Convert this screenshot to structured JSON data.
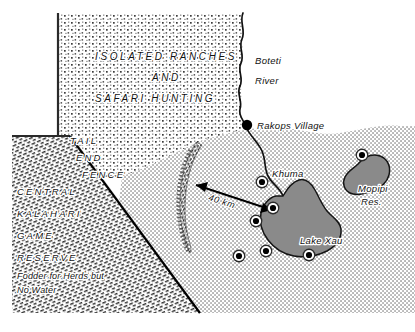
{
  "map": {
    "title": "Kalahari cattle-post map",
    "width": 415,
    "height": 332,
    "colors": {
      "paper": "#ffffff",
      "ink": "#111111",
      "water": "#8a8a8a",
      "water_outline": "#1a1a1a",
      "stipple_coarse": "#3a3a3a",
      "stipple_fine": "#4a4a4a",
      "hatch_reserve": "#2b2b2b",
      "fence_line": "#000000"
    },
    "regions": [
      {
        "id": "ranches",
        "name": "isolated-ranches-region",
        "fill_style": "coarse-stipple",
        "labels": [
          "ISOLATED  RANCHES",
          "AND",
          "SAFARI     HUNTING"
        ]
      },
      {
        "id": "reserve",
        "name": "central-kalahari-game-reserve",
        "fill_style": "dense-hatch",
        "labels": [
          "CENTRAL",
          "KALAHARI",
          "GAME",
          "RESERVE"
        ],
        "note_lines": [
          "Fodder  for  Herds  but",
          "No  Water"
        ]
      },
      {
        "id": "cattle_country",
        "name": "cattle-post-country",
        "fill_style": "fine-stipple",
        "labels": []
      }
    ],
    "labels": {
      "ranches_line1": "ISOLATED  RANCHES",
      "ranches_line2": "AND",
      "ranches_line3": "SAFARI     HUNTING",
      "fence_line1": "TAIL",
      "fence_line2": "END",
      "fence_line3": "FENCE",
      "reserve_line1": "CENTRAL",
      "reserve_line2": "KALAHARI",
      "reserve_line3": "GAME",
      "reserve_line4": "RESERVE",
      "reserve_note1": "Fodder  for  Herds  but",
      "reserve_note2": "No  Water",
      "river_line1": "Boteti",
      "river_line2": "River",
      "village": "Rakops Village",
      "khuma": "Khuma",
      "mopipi_line1": "Mopipi",
      "mopipi_line2": "Res.",
      "lake_xau": "Lake  Xau",
      "scale": "40  km"
    },
    "features": {
      "river": {
        "name": "Boteti River",
        "type": "river"
      },
      "lake_xau": {
        "name": "Lake Xau",
        "type": "lake"
      },
      "mopipi": {
        "name": "Mopipi Res.",
        "type": "reservoir"
      },
      "village": {
        "name": "Rakops Village",
        "type": "settlement"
      },
      "fence": {
        "name": "Tail End Fence",
        "type": "veterinary-fence"
      },
      "scale_arrow": {
        "label": "40 km",
        "type": "double-headed-arrow"
      }
    },
    "boreholes": [
      {
        "id": "bh1",
        "x": 262,
        "y": 182
      },
      {
        "id": "bh2",
        "x": 273,
        "y": 208
      },
      {
        "id": "bh3",
        "x": 256,
        "y": 221
      },
      {
        "id": "bh4",
        "x": 239,
        "y": 256
      },
      {
        "id": "bh5",
        "x": 266,
        "y": 251
      },
      {
        "id": "bh6",
        "x": 309,
        "y": 255
      },
      {
        "id": "bh7",
        "x": 362,
        "y": 155
      }
    ],
    "borehole_count": 7
  }
}
